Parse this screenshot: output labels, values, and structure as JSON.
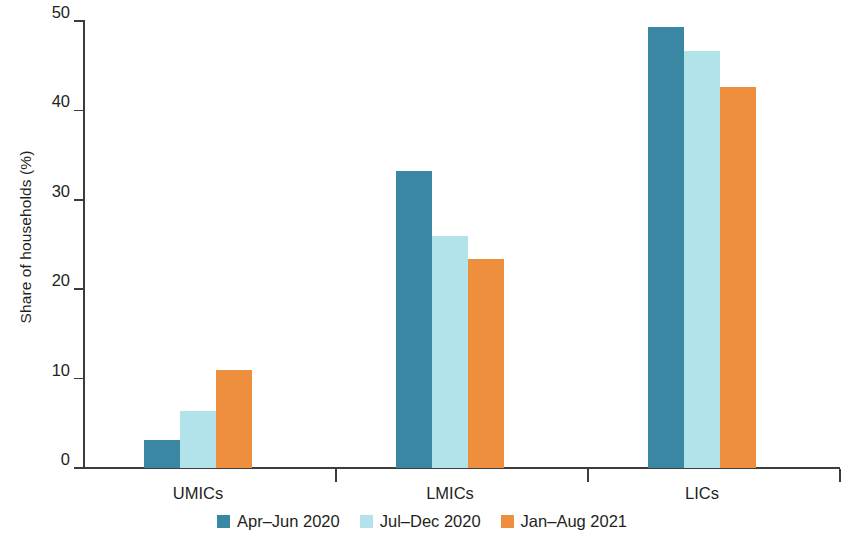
{
  "chart_data": {
    "type": "bar",
    "title": "",
    "subtitle": "",
    "xlabel": "",
    "ylabel": "Share of households (%)",
    "categories": [
      "UMICs",
      "LMICs",
      "LICs"
    ],
    "series": [
      {
        "name": "Apr–Jun 2020",
        "color": "#3a87a3",
        "values": [
          3.1,
          33.2,
          49.3
        ]
      },
      {
        "name": "Jul–Dec 2020",
        "color": "#b3e3ea",
        "values": [
          6.4,
          26.0,
          46.6
        ]
      },
      {
        "name": "Jan–Aug 2021",
        "color": "#ee8f3e",
        "values": [
          11.0,
          23.4,
          42.6
        ]
      }
    ],
    "ylim": [
      0,
      50
    ],
    "yticks": [
      0,
      10,
      20,
      30,
      40,
      50
    ],
    "ytick_labels": [
      "0",
      "10",
      "20",
      "30",
      "40",
      "50"
    ],
    "grid": false,
    "legend_position": "bottom"
  },
  "axis": {
    "y_label": "Share of households (%)"
  },
  "legend": {
    "items": [
      {
        "label": "Apr–Jun 2020",
        "color": "#3a87a3"
      },
      {
        "label": "Jul–Dec 2020",
        "color": "#b3e3ea"
      },
      {
        "label": "Jan–Aug 2021",
        "color": "#ee8f3e"
      }
    ]
  },
  "colors": {
    "series_1": "#3a87a3",
    "series_2": "#b3e3ea",
    "series_3": "#ee8f3e",
    "axis": "#3c3c3c",
    "text": "#231f20",
    "background": "#ffffff"
  }
}
